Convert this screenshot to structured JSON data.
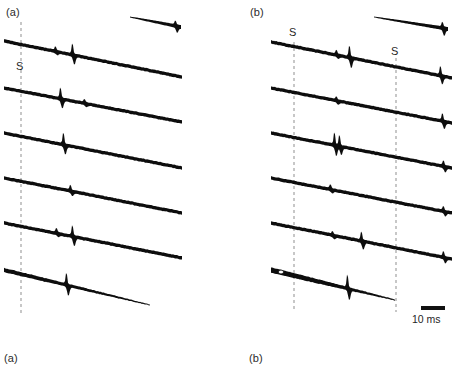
{
  "figure": {
    "width": 457,
    "height": 374,
    "background": "#ffffff",
    "ink_color": "#0d0d0d",
    "dash_color": "#8f8f8f",
    "caption_color": "#2b2b2b"
  },
  "panels": [
    {
      "id": "a",
      "top_label": "(a)",
      "top_label_x": 6,
      "top_label_y": 6,
      "bottom_label": "(a)",
      "bottom_label_x": 4,
      "bottom_label_y": 352,
      "stim_markers": [
        {
          "label": "S",
          "x": 16,
          "y": 60,
          "line_x": 21,
          "line_y0": 22,
          "line_y1": 316
        }
      ]
    },
    {
      "id": "b",
      "top_label": "(b)",
      "top_label_x": 250,
      "top_label_y": 6,
      "bottom_label": "(b)",
      "bottom_label_x": 249,
      "bottom_label_y": 352,
      "stim_markers": [
        {
          "label": "S",
          "x": 289,
          "y": 26,
          "line_x": 294,
          "line_y0": 42,
          "line_y1": 312
        },
        {
          "label": "S",
          "x": 391,
          "y": 45,
          "line_x": 396,
          "line_y0": 58,
          "line_y1": 312
        }
      ]
    }
  ],
  "scale_bar": {
    "label": "10 ms",
    "bar_x": 421,
    "bar_y": 306,
    "bar_width": 24,
    "bar_height": 4,
    "label_x": 412,
    "label_y": 313
  },
  "chart_data": {
    "type": "line",
    "title": "",
    "subtitle": "",
    "xlabel": "",
    "ylabel": "",
    "axis_units": {
      "x": "ms"
    },
    "scale_bar_ms": 10,
    "grid": false,
    "legend": "none",
    "panels": [
      {
        "id": "a",
        "n_sweeps": 6,
        "stimulus_times_px": [
          21
        ],
        "partial_sweep": {
          "x0": 130,
          "y0": 17,
          "x1": 181,
          "y1": 27,
          "spike_x": 176,
          "spike_up": 4,
          "spike_down": 5
        },
        "sweeps": [
          {
            "x0": 4,
            "y0": 41,
            "x1": 182,
            "y1": 77,
            "thickness": 3.4,
            "spikes": [
              {
                "x": 73,
                "up": 11,
                "down": 8
              },
              {
                "x": 56,
                "up": 4,
                "down": 2
              }
            ]
          },
          {
            "x0": 4,
            "y0": 88,
            "x1": 182,
            "y1": 122,
            "thickness": 3.4,
            "spikes": [
              {
                "x": 61,
                "up": 11,
                "down": 8
              },
              {
                "x": 85,
                "up": 3,
                "down": 2
              }
            ]
          },
          {
            "x0": 4,
            "y0": 133,
            "x1": 182,
            "y1": 168,
            "thickness": 3.4,
            "spikes": [
              {
                "x": 64,
                "up": 12,
                "down": 8
              }
            ]
          },
          {
            "x0": 4,
            "y0": 178,
            "x1": 182,
            "y1": 213,
            "thickness": 3.4,
            "spikes": [
              {
                "x": 71,
                "up": 5,
                "down": 3
              }
            ]
          },
          {
            "x0": 4,
            "y0": 223,
            "x1": 182,
            "y1": 258,
            "thickness": 3.4,
            "spikes": [
              {
                "x": 73,
                "up": 11,
                "down": 8
              },
              {
                "x": 57,
                "up": 4,
                "down": 2
              }
            ]
          },
          {
            "x0": 4,
            "y0": 270,
            "x1": 150,
            "y1": 305,
            "thickness": 3.4,
            "tapered": true,
            "spikes": [
              {
                "x": 67,
                "up": 12,
                "down": 9
              }
            ]
          }
        ]
      },
      {
        "id": "b",
        "n_sweeps": 6,
        "stimulus_times_px": [
          294,
          396
        ],
        "partial_sweep": {
          "x0": 374,
          "y0": 17,
          "x1": 448,
          "y1": 29,
          "spike_x": 443,
          "spike_up": 5,
          "spike_down": 6
        },
        "sweeps": [
          {
            "x0": 271,
            "y0": 42,
            "x1": 452,
            "y1": 78,
            "thickness": 3.4,
            "spikes": [
              {
                "x": 350,
                "up": 12,
                "down": 9
              },
              {
                "x": 337,
                "up": 4,
                "down": 2
              },
              {
                "x": 441,
                "up": 9,
                "down": 7
              }
            ]
          },
          {
            "x0": 271,
            "y0": 88,
            "x1": 452,
            "y1": 123,
            "thickness": 3.4,
            "spikes": [
              {
                "x": 337,
                "up": 3,
                "down": 2
              },
              {
                "x": 443,
                "up": 7,
                "down": 6
              }
            ]
          },
          {
            "x0": 271,
            "y0": 133,
            "x1": 452,
            "y1": 168,
            "thickness": 3.4,
            "spikes": [
              {
                "x": 335,
                "up": 13,
                "down": 9
              },
              {
                "x": 340,
                "up": 11,
                "down": 7
              },
              {
                "x": 444,
                "up": 5,
                "down": 4
              }
            ]
          },
          {
            "x0": 271,
            "y0": 178,
            "x1": 452,
            "y1": 213,
            "thickness": 3.4,
            "spikes": [
              {
                "x": 331,
                "up": 4,
                "down": 2
              },
              {
                "x": 444,
                "up": 4,
                "down": 3
              }
            ]
          },
          {
            "x0": 271,
            "y0": 223,
            "x1": 452,
            "y1": 259,
            "thickness": 3.4,
            "spikes": [
              {
                "x": 362,
                "up": 9,
                "down": 7
              },
              {
                "x": 333,
                "up": 3,
                "down": 2
              },
              {
                "x": 444,
                "up": 5,
                "down": 4
              }
            ]
          },
          {
            "x0": 271,
            "y0": 270,
            "x1": 395,
            "y1": 300,
            "thickness": 4.6,
            "tapered": true,
            "spikes": [
              {
                "x": 348,
                "up": 14,
                "down": 10
              }
            ]
          }
        ]
      }
    ]
  }
}
